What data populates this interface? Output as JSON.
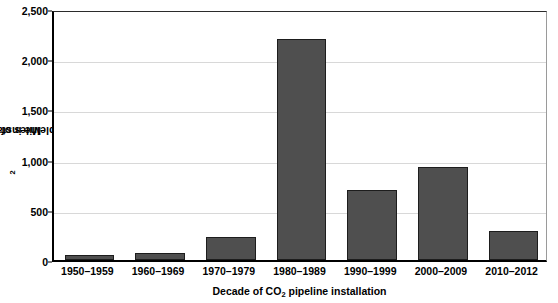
{
  "chart_data": {
    "type": "bar",
    "title": "",
    "xlabel_parts": {
      "pre": "Decade of CO",
      "sub": "2",
      "post": " pipeline installation"
    },
    "ylabel_parts": {
      "pre": "Miles of CO",
      "sub": "2",
      "post": " pipleine installed"
    },
    "xlabel": "Decade of CO2 pipeline installation",
    "ylabel": "Miles of CO2 pipleine installed",
    "categories": [
      "1950–1959",
      "1960–1969",
      "1970–1979",
      "1980–1989",
      "1990–1999",
      "2000–2009",
      "2010–2012"
    ],
    "values": [
      50,
      70,
      230,
      2200,
      700,
      930,
      290
    ],
    "ylim": [
      0,
      2500
    ],
    "ytick_values": [
      0,
      500,
      1000,
      1500,
      2000,
      2500
    ],
    "ytick_labels": [
      "0",
      "500",
      "1,000",
      "1,500",
      "2,000",
      "2,500"
    ],
    "grid": "horizontal",
    "legend": "none",
    "bar_color": "#4f4f4f",
    "bar_edge_color": "#1d1d1d",
    "grid_color": "#d8d8d8",
    "axis_color": "#000000",
    "background": "#ffffff"
  }
}
